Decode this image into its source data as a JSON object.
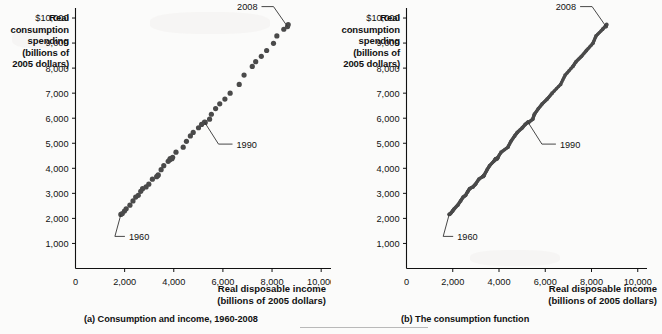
{
  "figure": {
    "bottom_rule": "horizontal-rule"
  },
  "panel_a": {
    "y_axis_title": "Real\nconsumption\nspending\n(billions of\n2005 dollars)",
    "y_axis_title_lines": [
      "Real",
      "consumption",
      "spending",
      "(billions of",
      "2005 dollars)"
    ],
    "x_axis_title_lines": [
      "Real disposable income",
      "(billions of 2005 dollars)"
    ],
    "caption": "(a) Consumption and income, 1960-2008",
    "y_ticks": [
      "$10,000",
      "9,000",
      "8,000",
      "7,000",
      "6,000",
      "5,000",
      "4,000",
      "3,000",
      "2,000",
      "1,000"
    ],
    "x_ticks": [
      "0",
      "2,000",
      "4,000",
      "6,000",
      "8,000",
      "10,000"
    ],
    "annotations": [
      {
        "label": "1960"
      },
      {
        "label": "1990"
      },
      {
        "label": "2008"
      }
    ]
  },
  "panel_b": {
    "y_axis_title_lines": [
      "Real",
      "consumption",
      "spending",
      "(billions of",
      "2005 dollars)"
    ],
    "x_axis_title_lines": [
      "Real disposable income",
      "(billions of 2005 dollars)"
    ],
    "caption": "(b)  The consumption function",
    "y_ticks": [
      "$10,000",
      "9,000",
      "8,000",
      "7,000",
      "6,000",
      "5,000",
      "4,000",
      "3,000",
      "2,000",
      "1,000"
    ],
    "x_ticks": [
      "0",
      "2,000",
      "4,000",
      "6,000",
      "8,000",
      "10,000"
    ],
    "annotations": [
      {
        "label": "1960"
      },
      {
        "label": "1990"
      },
      {
        "label": "2008"
      }
    ]
  },
  "chart_data": [
    {
      "type": "scatter",
      "title": "(a) Consumption and income, 1960-2008",
      "xlabel": "Real disposable income (billions of 2005 dollars)",
      "ylabel": "Real consumption spending (billions of 2005 dollars)",
      "xlim": [
        0,
        10400
      ],
      "ylim": [
        0,
        10400
      ],
      "xticks": [
        0,
        2000,
        4000,
        6000,
        8000,
        10000
      ],
      "yticks": [
        1000,
        2000,
        3000,
        4000,
        5000,
        6000,
        7000,
        8000,
        9000,
        10000
      ],
      "grid": false,
      "legend": "none",
      "marker_color": "#4a4a4a",
      "series": [
        {
          "name": "Consumption vs disposable income, 1960-2008",
          "points": [
            {
              "year": 1960,
              "x": 1846,
              "y": 2159
            },
            {
              "year": 1961,
              "x": 1905,
              "y": 2196
            },
            {
              "year": 1962,
              "x": 1993,
              "y": 2296
            },
            {
              "year": 1963,
              "x": 2062,
              "y": 2384
            },
            {
              "year": 1964,
              "x": 2215,
              "y": 2529
            },
            {
              "year": 1965,
              "x": 2340,
              "y": 2698
            },
            {
              "year": 1966,
              "x": 2449,
              "y": 2851
            },
            {
              "year": 1967,
              "x": 2555,
              "y": 2922
            },
            {
              "year": 1968,
              "x": 2655,
              "y": 3081
            },
            {
              "year": 1969,
              "x": 2730,
              "y": 3187
            },
            {
              "year": 1970,
              "x": 2873,
              "y": 3256
            },
            {
              "year": 1971,
              "x": 2983,
              "y": 3366
            },
            {
              "year": 1972,
              "x": 3129,
              "y": 3566
            },
            {
              "year": 1973,
              "x": 3356,
              "y": 3709
            },
            {
              "year": 1974,
              "x": 3302,
              "y": 3667
            },
            {
              "year": 1975,
              "x": 3366,
              "y": 3741
            },
            {
              "year": 1976,
              "x": 3485,
              "y": 3946
            },
            {
              "year": 1977,
              "x": 3593,
              "y": 4105
            },
            {
              "year": 1978,
              "x": 3772,
              "y": 4280
            },
            {
              "year": 1979,
              "x": 3853,
              "y": 4386
            },
            {
              "year": 1980,
              "x": 3840,
              "y": 4339
            },
            {
              "year": 1981,
              "x": 3926,
              "y": 4384
            },
            {
              "year": 1982,
              "x": 3954,
              "y": 4438
            },
            {
              "year": 1983,
              "x": 4090,
              "y": 4644
            },
            {
              "year": 1984,
              "x": 4384,
              "y": 4842
            },
            {
              "year": 1985,
              "x": 4516,
              "y": 5079
            },
            {
              "year": 1986,
              "x": 4676,
              "y": 5291
            },
            {
              "year": 1987,
              "x": 4791,
              "y": 5434
            },
            {
              "year": 1988,
              "x": 5007,
              "y": 5619
            },
            {
              "year": 1989,
              "x": 5132,
              "y": 5751
            },
            {
              "year": 1990,
              "x": 5251,
              "y": 5844
            },
            {
              "year": 1991,
              "x": 5281,
              "y": 5831
            },
            {
              "year": 1992,
              "x": 5458,
              "y": 5962
            },
            {
              "year": 1993,
              "x": 5530,
              "y": 6158
            },
            {
              "year": 1994,
              "x": 5703,
              "y": 6385
            },
            {
              "year": 1995,
              "x": 5871,
              "y": 6576
            },
            {
              "year": 1996,
              "x": 6081,
              "y": 6762
            },
            {
              "year": 1997,
              "x": 6295,
              "y": 7000
            },
            {
              "year": 1998,
              "x": 6664,
              "y": 7349
            },
            {
              "year": 1999,
              "x": 6861,
              "y": 7723
            },
            {
              "year": 2000,
              "x": 7195,
              "y": 8068
            },
            {
              "year": 2001,
              "x": 7334,
              "y": 8259
            },
            {
              "year": 2002,
              "x": 7563,
              "y": 8469
            },
            {
              "year": 2003,
              "x": 7780,
              "y": 8704
            },
            {
              "year": 2004,
              "x": 8059,
              "y": 8988
            },
            {
              "year": 2005,
              "x": 8196,
              "y": 9284
            },
            {
              "year": 2006,
              "x": 8479,
              "y": 9551
            },
            {
              "year": 2007,
              "x": 8658,
              "y": 9741
            },
            {
              "year": 2008,
              "x": 8631,
              "y": 9658
            }
          ]
        }
      ],
      "annotations": [
        {
          "label": "1960",
          "x": 1846,
          "y": 2159
        },
        {
          "label": "1990",
          "x": 5251,
          "y": 5844
        },
        {
          "label": "2008",
          "x": 8631,
          "y": 9658
        }
      ]
    },
    {
      "type": "scatter",
      "title": "(b)  The consumption function",
      "xlabel": "Real disposable income (billions of 2005 dollars)",
      "ylabel": "Real consumption spending (billions of 2005 dollars)",
      "xlim": [
        0,
        10400
      ],
      "ylim": [
        0,
        10400
      ],
      "xticks": [
        0,
        2000,
        4000,
        6000,
        8000,
        10000
      ],
      "yticks": [
        1000,
        2000,
        3000,
        4000,
        5000,
        6000,
        7000,
        8000,
        9000,
        10000
      ],
      "grid": false,
      "legend": "none",
      "marker_color": "#4a4a4a",
      "note": "Same data as panel (a) drawn as a dense continuous band: the consumption function line through the points",
      "series": [
        {
          "name": "Consumption function (fitted line through data)",
          "points": [
            {
              "year": 1960,
              "x": 1846,
              "y": 2159
            },
            {
              "year": 1970,
              "x": 2873,
              "y": 3256
            },
            {
              "year": 1980,
              "x": 3840,
              "y": 4339
            },
            {
              "year": 1990,
              "x": 5251,
              "y": 5844
            },
            {
              "year": 2000,
              "x": 7195,
              "y": 8068
            },
            {
              "year": 2008,
              "x": 8631,
              "y": 9658
            }
          ]
        }
      ],
      "annotations": [
        {
          "label": "1960",
          "x": 1846,
          "y": 2159
        },
        {
          "label": "1990",
          "x": 5251,
          "y": 5844
        },
        {
          "label": "2008",
          "x": 8631,
          "y": 9658
        }
      ]
    }
  ]
}
